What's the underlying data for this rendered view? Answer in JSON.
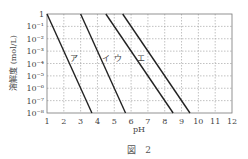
{
  "chart_data": {
    "type": "line",
    "title": "",
    "caption": "図　2",
    "xlabel": "pH",
    "ylabel": "溶解度 (mol/L)",
    "xlim": [
      1,
      12
    ],
    "ylim_log10": [
      -8,
      0
    ],
    "yscale": "log",
    "grid": true,
    "x_ticks": [
      "1",
      "2",
      "3",
      "4",
      "5",
      "6",
      "7",
      "8",
      "9",
      "10",
      "11",
      "12"
    ],
    "y_ticks": [
      "1",
      "10⁻¹",
      "10⁻²",
      "10⁻³",
      "10⁻⁴",
      "10⁻⁵",
      "10⁻⁶",
      "10⁻⁷",
      "10⁻⁸"
    ],
    "series": [
      {
        "name": "ア",
        "x": [
          1.0,
          3.67
        ],
        "log10_y": [
          0,
          -8
        ]
      },
      {
        "name": "イ",
        "x": [
          3.0,
          5.67
        ],
        "log10_y": [
          0,
          -8
        ]
      },
      {
        "name": "ウ",
        "x": [
          4.5,
          8.5
        ],
        "log10_y": [
          0,
          -8
        ]
      },
      {
        "name": "エ",
        "x": [
          5.5,
          9.5
        ],
        "log10_y": [
          0,
          -8
        ]
      }
    ],
    "labels": [
      {
        "text": "ア",
        "x": 2.6,
        "log10_y": -3.8
      },
      {
        "text": "イ",
        "x": 4.5,
        "log10_y": -3.8
      },
      {
        "text": "ウ",
        "x": 5.2,
        "log10_y": -3.8
      },
      {
        "text": "エ",
        "x": 6.6,
        "log10_y": -3.8
      }
    ]
  }
}
